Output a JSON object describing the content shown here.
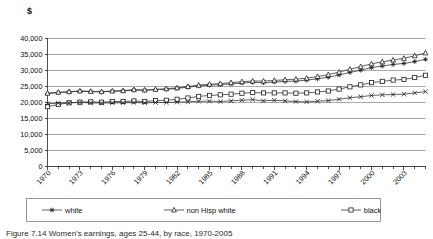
{
  "figure": {
    "y_axis_unit_label": "$",
    "caption": "Figure 7.14  Women's earnings, ages 25-44, by race, 1970-2005"
  },
  "legend": {
    "items": [
      {
        "label": "white",
        "marker": "star-marker",
        "marker_glyph": "✶"
      },
      {
        "label": "non Hisp white",
        "marker": "triangle-marker",
        "marker_glyph": "△"
      },
      {
        "label": "black",
        "marker": "square-marker",
        "marker_glyph": "□"
      },
      {
        "label": "Latina",
        "marker": "cross-marker",
        "marker_glyph": "×"
      }
    ]
  },
  "chart_data": {
    "type": "line",
    "title": "",
    "xlabel": "",
    "ylabel": "$",
    "ylim": [
      0,
      40000
    ],
    "xlim": [
      1970,
      2005
    ],
    "grid": true,
    "legend_position": "bottom",
    "ytick_labels": [
      "0",
      "5,000",
      "10,000",
      "15,000",
      "20,000",
      "25,000",
      "30,000",
      "35,000",
      "40,000"
    ],
    "ytick_values": [
      0,
      5000,
      10000,
      15000,
      20000,
      25000,
      30000,
      35000,
      40000
    ],
    "xtick_labels": [
      "1970",
      "1973",
      "1976",
      "1979",
      "1982",
      "1985",
      "1988",
      "1991",
      "1994",
      "1997",
      "2000",
      "2003"
    ],
    "xtick_values": [
      1970,
      1973,
      1976,
      1979,
      1982,
      1985,
      1988,
      1991,
      1994,
      1997,
      2000,
      2003
    ],
    "x": [
      1970,
      1971,
      1972,
      1973,
      1974,
      1975,
      1976,
      1977,
      1978,
      1979,
      1980,
      1981,
      1982,
      1983,
      1984,
      1985,
      1986,
      1987,
      1988,
      1989,
      1990,
      1991,
      1992,
      1993,
      1994,
      1995,
      1996,
      1997,
      1998,
      1999,
      2000,
      2001,
      2002,
      2003,
      2004,
      2005
    ],
    "series": [
      {
        "name": "white",
        "marker": "star-marker",
        "values": [
          22800,
          23100,
          23300,
          23500,
          23400,
          23300,
          23500,
          23600,
          23900,
          23800,
          24000,
          24100,
          24400,
          24800,
          25200,
          25400,
          25600,
          25800,
          26100,
          26300,
          26200,
          26400,
          26600,
          26700,
          27000,
          27400,
          27900,
          28600,
          29400,
          30100,
          30900,
          31400,
          31900,
          32200,
          32800,
          33500
        ]
      },
      {
        "name": "non Hisp white",
        "marker": "triangle-marker",
        "values": [
          22900,
          23200,
          23400,
          23600,
          23500,
          23400,
          23600,
          23700,
          24000,
          23900,
          24100,
          24300,
          24600,
          25000,
          25400,
          25700,
          25900,
          26200,
          26500,
          26700,
          26700,
          26900,
          27100,
          27300,
          27600,
          28100,
          28700,
          29500,
          30400,
          31200,
          32100,
          32700,
          33300,
          33800,
          34600,
          35500
        ]
      },
      {
        "name": "black",
        "marker": "square-marker",
        "values": [
          18700,
          19400,
          19900,
          20100,
          20200,
          20100,
          20300,
          20300,
          20500,
          20300,
          20600,
          20700,
          21000,
          21400,
          21900,
          22200,
          22400,
          22600,
          22900,
          23100,
          23000,
          23000,
          23000,
          22900,
          23000,
          23300,
          23600,
          24200,
          24900,
          25500,
          26200,
          26600,
          27000,
          27200,
          27800,
          28500
        ]
      },
      {
        "name": "Latina",
        "marker": "cross-marker",
        "values": [
          19600,
          19800,
          19900,
          20000,
          19900,
          19800,
          19900,
          19900,
          20000,
          19900,
          20000,
          20000,
          20100,
          20200,
          20400,
          20400,
          20300,
          20500,
          20700,
          20900,
          20500,
          20700,
          20500,
          20300,
          20200,
          20400,
          20600,
          21000,
          21500,
          21800,
          22200,
          22400,
          22500,
          22600,
          23000,
          23400
        ]
      }
    ]
  }
}
